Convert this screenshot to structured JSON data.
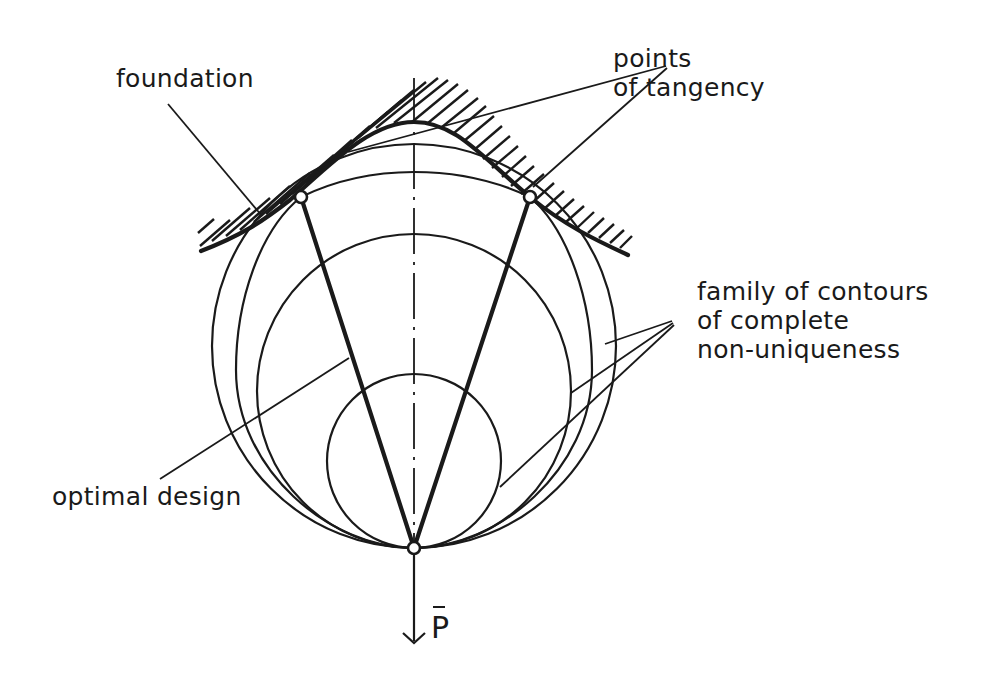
{
  "figure": {
    "type": "structural optimization diagram",
    "labels": {
      "foundation": "foundation",
      "points_of_tangency": "points\nof tangency",
      "family_of_contours": "family of contours\nof complete\nnon-uniqueness",
      "optimal_design": "optimal design",
      "load": "P"
    },
    "elements": {
      "bars": 2,
      "nodes": [
        "left-support-node",
        "right-support-node",
        "load-node"
      ],
      "contours": [
        "small-contour",
        "medium-contour",
        "large-contour",
        "optimal-design-contour"
      ],
      "load_symbol": "P with overbar, downward arrow"
    },
    "colors": {
      "ink": "#1a1a1a",
      "background": "#ffffff"
    }
  }
}
